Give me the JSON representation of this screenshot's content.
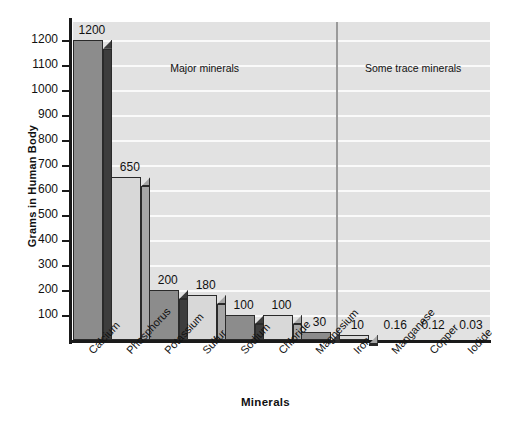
{
  "chart_data": {
    "type": "bar",
    "title": "",
    "xlabel": "Minerals",
    "ylabel": "Grams in Human Body",
    "ylim": [
      0,
      1270
    ],
    "grid": true,
    "legend": "none",
    "categories": [
      "Calcium",
      "Phosphorus",
      "Potassium",
      "Sulfur",
      "Sodium",
      "Chloride",
      "Magnesium",
      "Iron",
      "Manganese",
      "Copper",
      "Iodide"
    ],
    "values": [
      1200,
      650,
      200,
      180,
      100,
      100,
      30,
      10,
      0.16,
      0.12,
      0.03
    ],
    "value_labels": [
      "1200",
      "650",
      "200",
      "180",
      "100",
      "100",
      "30",
      "10",
      "0.16",
      "0.12",
      "0.03"
    ],
    "ytick_labels": [
      "1200",
      "1100",
      "1000",
      "900",
      "800",
      "700",
      "600",
      "500",
      "400",
      "300",
      "200",
      "100"
    ],
    "ytick_values": [
      1200,
      1100,
      1000,
      900,
      800,
      700,
      600,
      500,
      400,
      300,
      200,
      100
    ],
    "annotations": [
      {
        "text": "Major minerals",
        "region": "left"
      },
      {
        "text": "Some trace minerals",
        "region": "right"
      }
    ],
    "bar_styles": [
      "dark",
      "light",
      "dark",
      "light",
      "dark",
      "light",
      "dark",
      "light",
      "none",
      "none",
      "none"
    ],
    "colors": {
      "plot_background": "#e2e2e2",
      "gridline": "#fafafa",
      "axis": "#1a1a1a",
      "bar_dark_face": "#8c8c8c",
      "bar_dark_side": "#3d3d3d",
      "bar_light_face": "#d8d8d8",
      "bar_light_side": "#a6a6a6",
      "divider": "#9a9a9a",
      "text": "#111111",
      "page_background": "#ffffff"
    }
  },
  "axis_titles": {
    "x": "Minerals",
    "y": "Grams in Human Body"
  }
}
